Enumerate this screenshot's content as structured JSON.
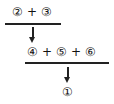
{
  "diagram": {
    "step1": {
      "terms": [
        "②",
        "③"
      ],
      "operator": "+"
    },
    "step2": {
      "terms": [
        "④",
        "⑤",
        "⑥"
      ],
      "operator": "+"
    },
    "result": "①"
  }
}
